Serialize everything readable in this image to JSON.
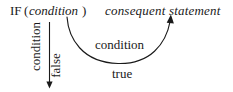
{
  "figure": {
    "type": "flow-diagram",
    "background_color": "#ffffff",
    "ink_color": "#1a1a1a"
  },
  "header": {
    "if_keyword": "IF",
    "open_paren": "(",
    "condition_italic": "condition",
    "close_paren": ")",
    "consequent_statement": "consequent statement"
  },
  "labels": {
    "curve_condition": "condition",
    "true_branch": "true",
    "false_branch": "false",
    "vertical_condition": "condition"
  },
  "arrows": {
    "false_arrow_name": "downward-false-arrow",
    "true_arrow_name": "curved-true-arrow"
  }
}
